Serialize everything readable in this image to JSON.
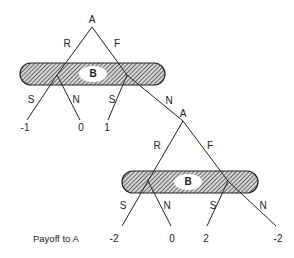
{
  "diagram": {
    "type": "extensive-form game tree",
    "nodes": {
      "root": {
        "label": "A"
      },
      "info_set_1": {
        "label": "B"
      },
      "second_a": {
        "label": "A"
      },
      "info_set_2": {
        "label": "B"
      }
    },
    "edges": {
      "root_R": "R",
      "root_F": "F",
      "set1_left_S": "S",
      "set1_left_N": "N",
      "set1_right_S": "S",
      "set1_right_N": "N",
      "a2_R": "R",
      "a2_F": "F",
      "set2_left_S": "S",
      "set2_left_N": "N",
      "set2_right_S": "S",
      "set2_right_N": "N"
    },
    "payoffs_upper": [
      "-1",
      "0",
      "1"
    ],
    "payoffs_lower": [
      "-2",
      "0",
      "2",
      "-2"
    ],
    "caption": "Payoff to A"
  }
}
